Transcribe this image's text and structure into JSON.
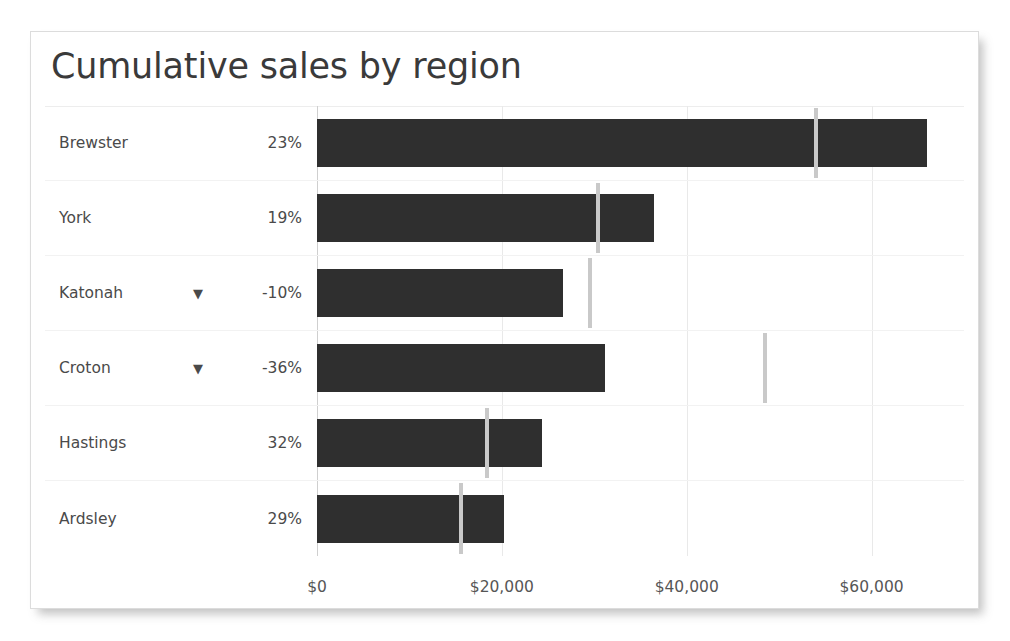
{
  "card": {
    "title": "Cumulative sales by region"
  },
  "chart_data": {
    "type": "bar",
    "title": "Cumulative sales by region",
    "orientation": "horizontal",
    "xlabel": "",
    "ylabel": "",
    "xlim": [
      0,
      70000
    ],
    "grid": true,
    "legend": null,
    "bar_color": "#2f2f2f",
    "target_color": "#c9c9c9",
    "axis_ticks": [
      {
        "value": 0,
        "label": "$0"
      },
      {
        "value": 20000,
        "label": "$20,000"
      },
      {
        "value": 40000,
        "label": "$40,000"
      },
      {
        "value": 60000,
        "label": "$60,000"
      }
    ],
    "categories": [
      "Brewster",
      "York",
      "Katonah",
      "Croton",
      "Hastings",
      "Ardsley"
    ],
    "values": [
      66000,
      36500,
      26600,
      31200,
      24300,
      20200
    ],
    "targets": [
      54000,
      30400,
      29500,
      48500,
      18400,
      15600
    ],
    "series": [
      {
        "name": "Cumulative sales",
        "values": [
          66000,
          36500,
          26600,
          31200,
          24300,
          20200
        ]
      },
      {
        "name": "Target",
        "values": [
          54000,
          30400,
          29500,
          48500,
          18400,
          15600
        ]
      }
    ],
    "rows": [
      {
        "region": "Brewster",
        "delta": "23%",
        "negative": false,
        "arrow": "",
        "value": 66000,
        "target": 54000
      },
      {
        "region": "York",
        "delta": "19%",
        "negative": false,
        "arrow": "",
        "value": 36500,
        "target": 30400
      },
      {
        "region": "Katonah",
        "delta": "-10%",
        "negative": true,
        "arrow": "▼",
        "value": 26600,
        "target": 29500
      },
      {
        "region": "Croton",
        "delta": "-36%",
        "negative": true,
        "arrow": "▼",
        "value": 31200,
        "target": 48500
      },
      {
        "region": "Hastings",
        "delta": "32%",
        "negative": false,
        "arrow": "",
        "value": 24300,
        "target": 18400
      },
      {
        "region": "Ardsley",
        "delta": "29%",
        "negative": false,
        "arrow": "",
        "value": 20200,
        "target": 15600
      }
    ]
  }
}
